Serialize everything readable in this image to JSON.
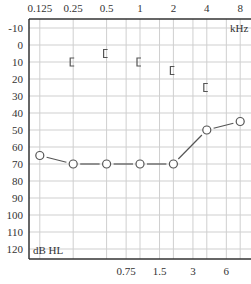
{
  "chart_data": {
    "type": "line",
    "title": "",
    "xlabel": "kHz",
    "ylabel": "dB HL",
    "x_scale": "log2",
    "top_tick_labels": [
      "0.125",
      "0.25",
      "0.5",
      "1",
      "2",
      "4",
      "8"
    ],
    "top_tick_values": [
      0.125,
      0.25,
      0.5,
      1,
      2,
      4,
      8
    ],
    "bottom_tick_labels": [
      "0.75",
      "1.5",
      "3",
      "6"
    ],
    "bottom_tick_values": [
      0.75,
      1.5,
      3,
      6
    ],
    "y_tick_labels": [
      "-10",
      "0",
      "10",
      "20",
      "30",
      "40",
      "50",
      "60",
      "70",
      "80",
      "90",
      "100",
      "110",
      "120"
    ],
    "y_tick_values": [
      -10,
      0,
      10,
      20,
      30,
      40,
      50,
      60,
      70,
      80,
      90,
      100,
      110,
      120
    ],
    "ylim": [
      -10,
      120
    ],
    "y_inverted": true,
    "grid": true,
    "series": [
      {
        "name": "Air conduction (right ear)",
        "marker": "circle",
        "connected": true,
        "x": [
          0.125,
          0.25,
          0.5,
          1,
          2,
          4,
          8
        ],
        "values": [
          65,
          70,
          70,
          70,
          70,
          50,
          45
        ]
      },
      {
        "name": "Masked bone conduction (right ear)",
        "marker": "left-bracket",
        "connected": false,
        "x": [
          0.25,
          0.5,
          1,
          2,
          4
        ],
        "values": [
          10,
          5,
          10,
          15,
          25
        ]
      }
    ]
  },
  "labels": {
    "x_unit": "kHz",
    "y_unit": "dB HL"
  },
  "colors": {
    "axis": "#333333",
    "grid": "#cfcfcf",
    "series": "#555555",
    "text": "#333333"
  }
}
